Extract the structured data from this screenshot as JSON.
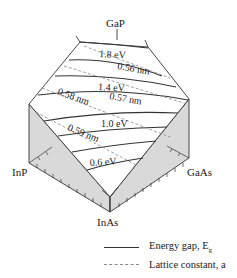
{
  "vertices": {
    "top": "GaP",
    "left": "InP",
    "right": "GaAs",
    "bottom": "InAs"
  },
  "energy_gap_contours": [
    {
      "label": "1.8 eV"
    },
    {
      "label": "1.4 eV"
    },
    {
      "label": "1.0 eV"
    },
    {
      "label": "0.6 eV"
    }
  ],
  "lattice_constant_contours": [
    {
      "label": "0.56 nm"
    },
    {
      "label": "0.57 nm"
    },
    {
      "label": "0.58 nm"
    },
    {
      "label": "0.59 nm"
    }
  ],
  "legend": {
    "items": [
      {
        "style": "solid",
        "label": "Energy gap, E",
        "subscript": "g"
      },
      {
        "style": "dashed",
        "label": "Lattice constant, a"
      }
    ]
  },
  "colors": {
    "line": "#333333",
    "dashed": "#888888",
    "side_fill": "#d9d9d9",
    "background": "#ffffff"
  }
}
